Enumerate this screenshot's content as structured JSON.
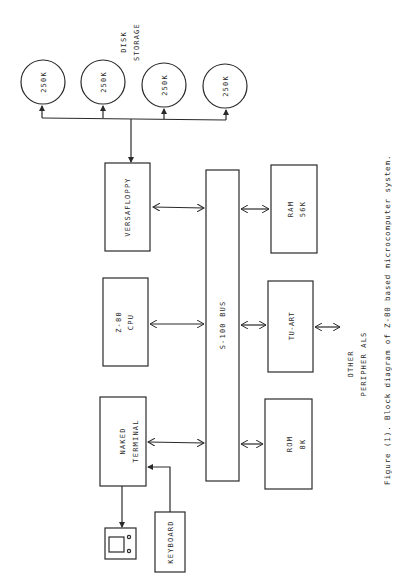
{
  "figure": {
    "caption": "Figure (1).  Block diagram of Z-80 based microcomputer system.",
    "orientation": "rotated 90° counter-clockwise (text reads bottom-to-top)"
  },
  "disk_storage": {
    "label_line1": "DISK",
    "label_line2": "STORAGE",
    "drives": [
      {
        "label": "250K"
      },
      {
        "label": "250K"
      },
      {
        "label": "250K"
      },
      {
        "label": "250K"
      }
    ]
  },
  "blocks": {
    "versafloppy": {
      "line1": "VERSAFLOPPY"
    },
    "cpu": {
      "line1": "Z-80",
      "line2": "CPU"
    },
    "terminal": {
      "line1": "NAKED",
      "line2": "TERMINAL"
    },
    "bus": {
      "line1": "S-100 BUS"
    },
    "ram": {
      "line1": "RAM",
      "line2": "56K"
    },
    "tuart": {
      "line1": "TU-ART"
    },
    "rom": {
      "line1": "ROM",
      "line2": "8K"
    },
    "keyboard": {
      "line1": "KEYBOARD"
    }
  },
  "peripherals": {
    "line1": "OTHER",
    "line2": "PERIPHER ALS"
  },
  "colors": {
    "line": "#2a2a2a",
    "background": "#ffffff"
  }
}
